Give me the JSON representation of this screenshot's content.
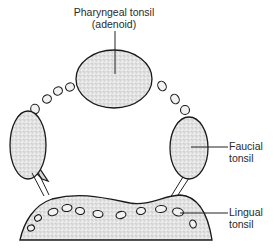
{
  "diagram": {
    "labels": {
      "pharyngeal_line1": "Pharyngeal tonsil",
      "pharyngeal_line2": "(adenoid)",
      "faucial_line1": "Faucial",
      "faucial_line2": "tonsil",
      "lingual_line1": "Lingual",
      "lingual_line2": "tonsil"
    },
    "structures": [
      {
        "id": "pharyngeal-tonsil",
        "name": "Pharyngeal tonsil (adenoid)"
      },
      {
        "id": "left-faucial-tonsil",
        "name": "Faucial tonsil (left)"
      },
      {
        "id": "right-faucial-tonsil",
        "name": "Faucial tonsil"
      },
      {
        "id": "lingual-tonsil",
        "name": "Lingual tonsil"
      },
      {
        "id": "lymphoid-nodules",
        "name": "Lymphoid nodules"
      }
    ],
    "colors": {
      "ink": "#1a1a1a",
      "tissue_fill": "#e6e6e6",
      "background": "#ffffff"
    }
  }
}
